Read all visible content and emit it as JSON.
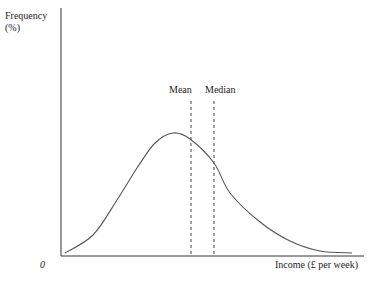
{
  "chart_data": {
    "type": "line",
    "title": "",
    "ylabel": "Frequency (%)",
    "xlabel": "Income (£ per week)",
    "origin_label": "0",
    "grid": false,
    "legend": null,
    "annotations": [
      {
        "label": "Mean",
        "style": "dashed vertical line",
        "x_px": 191
      },
      {
        "label": "Median",
        "style": "dashed vertical line",
        "x_px": 214
      }
    ],
    "series": [
      {
        "name": "Income distribution",
        "points_px": [
          [
            65,
            253
          ],
          [
            93,
            235
          ],
          [
            117,
            200
          ],
          [
            137,
            168
          ],
          [
            155,
            143
          ],
          [
            173,
            133
          ],
          [
            190,
            139
          ],
          [
            214,
            163
          ],
          [
            230,
            193
          ],
          [
            260,
            222
          ],
          [
            290,
            241
          ],
          [
            320,
            251
          ],
          [
            352,
            253
          ]
        ]
      }
    ]
  },
  "labels": {
    "ylabel_line1": "Frequency",
    "ylabel_line2": "(%)",
    "zero": "0",
    "xlabel": "Income (£ per week)",
    "mean": "Mean",
    "median": "Median"
  },
  "colors": {
    "axis": "#333333",
    "curve": "#555555",
    "dashed": "#444444"
  }
}
